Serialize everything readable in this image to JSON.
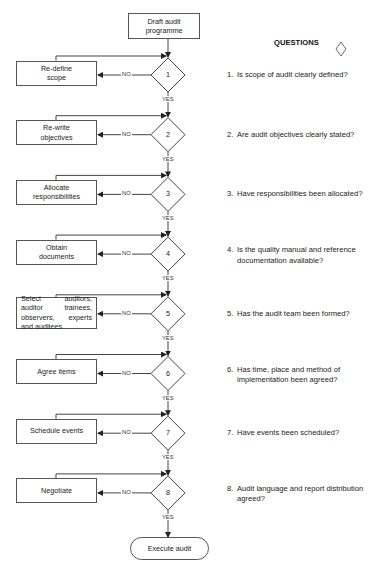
{
  "start": {
    "label": "Draft audit\nprogramme"
  },
  "end": {
    "label": "Execute audit"
  },
  "questions_header": {
    "label": "QUESTIONS",
    "icon": "diamond-icon"
  },
  "labels": {
    "no": "NO",
    "yes": "YES"
  },
  "steps": [
    {
      "number": "1",
      "action": "Re-define\nscope",
      "question_number": "1.",
      "question": "Is scope of audit clearly defined?"
    },
    {
      "number": "2",
      "action": "Re-write\nobjectives",
      "question_number": "2.",
      "question": "Are audit objectives clearly stated?"
    },
    {
      "number": "3",
      "action": "Allocate\nresponsibilities",
      "question_number": "3.",
      "question": "Have responsibilities been allocated?"
    },
    {
      "number": "4",
      "action": "Obtain\ndocuments",
      "question_number": "4.",
      "question": "Is the quality manual and reference documentation available?"
    },
    {
      "number": "5",
      "action": "Select auditors, auditor trainees, observers, experts and auditees",
      "question_number": "5.",
      "question": "Has the audit team been formed?"
    },
    {
      "number": "6",
      "action": "Agree items",
      "question_number": "6.",
      "question": "Has time, place and method of implementation been agreed?"
    },
    {
      "number": "7",
      "action": "Schedule events",
      "question_number": "7.",
      "question": "Have events been scheduled?"
    },
    {
      "number": "8",
      "action": "Negotiate",
      "question_number": "8.",
      "question": "Audit language and report distribution agreed?"
    }
  ],
  "colors": {
    "line": "#444444",
    "text": "#222222",
    "background": "#ffffff"
  }
}
